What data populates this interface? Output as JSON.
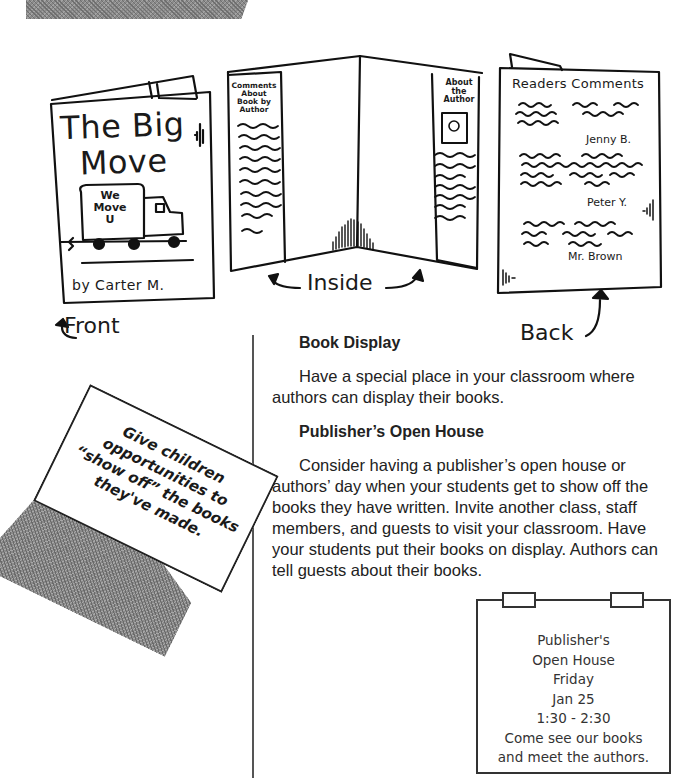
{
  "illustrations": {
    "front": {
      "title_line1": "The Big",
      "title_line2": "Move",
      "truck_text_line1": "We",
      "truck_text_line2": "Move",
      "truck_text_line3": "U",
      "byline": "by Carter M.",
      "label": "Front"
    },
    "inside": {
      "left_panel_heading_lines": [
        "Comments",
        "About",
        "Book by",
        "Author"
      ],
      "right_panel_heading_lines": [
        "About",
        "the",
        "Author"
      ],
      "label": "Inside"
    },
    "back": {
      "title": "Readers Comments",
      "commenters": [
        "Jenny B.",
        "Peter Y.",
        "Mr. Brown"
      ],
      "label": "Back"
    }
  },
  "note_card": {
    "lines": [
      "Give children",
      "opportunities to",
      "“show off” the books",
      "they've made."
    ]
  },
  "sections": [
    {
      "heading": "Book Display",
      "body": "Have a special place in your classroom where authors can display their books."
    },
    {
      "heading": "Publisher’s Open House",
      "body": "Consider having a publisher’s open house or authors’ day when your students get to show off the books they have written. Invite another class, staff members, and guests to visit your classroom. Have your students put their books on display. Authors can tell guests about their books."
    }
  ],
  "sign": {
    "lines": [
      "Publisher's",
      "Open House",
      "Friday",
      "Jan 25",
      "1:30 - 2:30",
      "Come see our books",
      "and meet the authors."
    ]
  }
}
